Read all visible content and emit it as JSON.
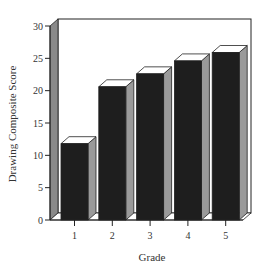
{
  "chart_data": {
    "type": "bar",
    "style": "3d",
    "title": "",
    "xlabel": "Grade",
    "ylabel": "Drawing Composite Score",
    "categories": [
      "1",
      "2",
      "3",
      "4",
      "5"
    ],
    "values": [
      11.8,
      20.6,
      22.6,
      24.6,
      25.9
    ],
    "ylim": [
      0,
      30
    ],
    "yticks": [
      "0",
      "5",
      "10",
      "15",
      "20",
      "25",
      "30"
    ],
    "grid": false,
    "legend": null,
    "colors": {
      "bar_front": "#1e1e1e",
      "bar_side": "#9a9a9a",
      "bar_top": "#ffffff",
      "wall": "#ffffff",
      "side_wall": "#8a8a8a",
      "outline": "#222222"
    }
  }
}
